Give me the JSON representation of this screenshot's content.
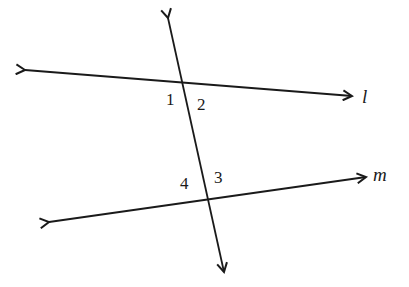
{
  "diagram": {
    "type": "parallel lines cut by a transversal",
    "stroke_color": "#1a1a1a",
    "background": "#ffffff",
    "lines": [
      {
        "name": "l",
        "label": "l",
        "from": [
          25,
          70
        ],
        "to": [
          352,
          96
        ],
        "label_pos": [
          362,
          103
        ]
      },
      {
        "name": "m",
        "label": "m",
        "from": [
          49,
          222
        ],
        "to": [
          366,
          177
        ],
        "label_pos": [
          373,
          181
        ]
      },
      {
        "name": "transversal",
        "label": "",
        "from": [
          168,
          18
        ],
        "to": [
          224,
          272
        ]
      }
    ],
    "angles": [
      {
        "label": "1",
        "pos": [
          166,
          105
        ]
      },
      {
        "label": "2",
        "pos": [
          197,
          110
        ]
      },
      {
        "label": "3",
        "pos": [
          214,
          183
        ]
      },
      {
        "label": "4",
        "pos": [
          180,
          189
        ]
      }
    ]
  }
}
